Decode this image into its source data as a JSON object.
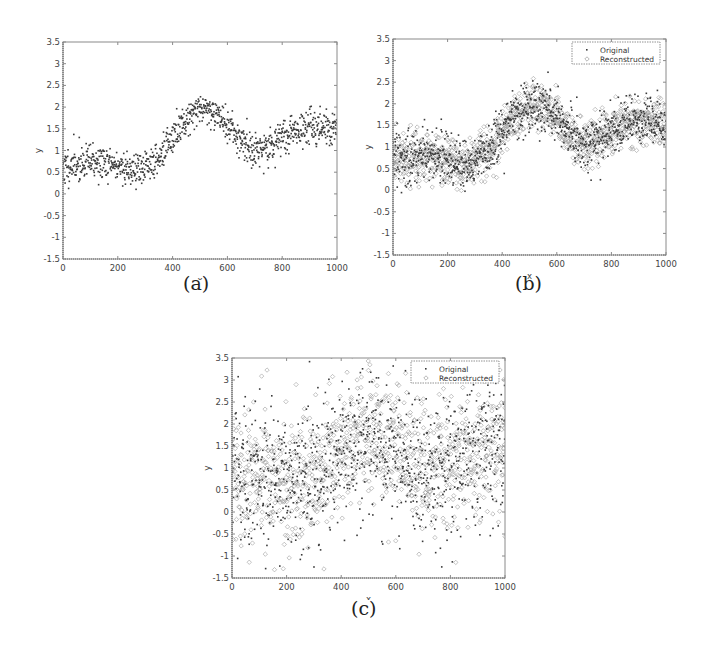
{
  "figure": {
    "captions": [
      "(a)",
      "(b)",
      "(c)"
    ]
  },
  "chart_data": [
    {
      "id": "a",
      "type": "scatter",
      "caption": "(a)",
      "title": "",
      "xlabel": "x",
      "ylabel": "y",
      "xlim": [
        0,
        1000
      ],
      "ylim": [
        -1.5,
        3.5
      ],
      "xticks": [
        0,
        200,
        400,
        600,
        800,
        1000
      ],
      "yticks": [
        -1.5,
        -1,
        -0.5,
        0,
        0.5,
        1,
        1.5,
        2,
        2.5,
        3,
        3.5
      ],
      "grid": false,
      "legend": null,
      "series": [
        {
          "name": "Original",
          "marker": "dot",
          "n_points": 1000,
          "trend_x": [
            0,
            100,
            200,
            250,
            300,
            350,
            400,
            450,
            500,
            550,
            600,
            650,
            700,
            750,
            800,
            850,
            900,
            950,
            1000
          ],
          "trend_y": [
            0.6,
            0.75,
            0.65,
            0.55,
            0.6,
            0.85,
            1.25,
            1.75,
            2.0,
            1.9,
            1.6,
            1.2,
            1.0,
            1.05,
            1.3,
            1.45,
            1.55,
            1.55,
            1.5
          ],
          "noise_sd": 0.2
        }
      ]
    },
    {
      "id": "b",
      "type": "scatter",
      "caption": "(b)",
      "title": "",
      "xlabel": "x",
      "ylabel": "y",
      "xlim": [
        0,
        1000
      ],
      "ylim": [
        -1.5,
        3.5
      ],
      "xticks": [
        0,
        200,
        400,
        600,
        800,
        1000
      ],
      "yticks": [
        -1.5,
        -1,
        -0.5,
        0,
        0.5,
        1,
        1.5,
        2,
        2.5,
        3,
        3.5
      ],
      "grid": false,
      "legend": {
        "position": "upper right",
        "entries": [
          "Original",
          "Reconstructed"
        ]
      },
      "series": [
        {
          "name": "Original",
          "marker": "dot",
          "n_points": 1000,
          "trend_x": [
            0,
            100,
            200,
            250,
            300,
            350,
            400,
            450,
            500,
            550,
            600,
            650,
            700,
            750,
            800,
            850,
            900,
            950,
            1000
          ],
          "trend_y": [
            0.7,
            0.8,
            0.7,
            0.6,
            0.65,
            0.9,
            1.3,
            1.8,
            2.0,
            1.95,
            1.7,
            1.25,
            1.05,
            1.15,
            1.4,
            1.55,
            1.6,
            1.6,
            1.55
          ],
          "noise_sd": 0.3
        },
        {
          "name": "Reconstructed",
          "marker": "diamond",
          "n_points": 1000,
          "trend_x": [
            0,
            100,
            200,
            250,
            300,
            350,
            400,
            450,
            500,
            550,
            600,
            650,
            700,
            750,
            800,
            850,
            900,
            950,
            1000
          ],
          "trend_y": [
            0.7,
            0.8,
            0.7,
            0.6,
            0.65,
            0.9,
            1.3,
            1.8,
            2.0,
            1.95,
            1.7,
            1.25,
            1.05,
            1.15,
            1.4,
            1.55,
            1.6,
            1.6,
            1.55
          ],
          "noise_sd": 0.28
        }
      ]
    },
    {
      "id": "c",
      "type": "scatter",
      "caption": "(c)",
      "title": "",
      "xlabel": "x",
      "ylabel": "y",
      "xlim": [
        0,
        1000
      ],
      "ylim": [
        -1.5,
        3.5
      ],
      "xticks": [
        0,
        200,
        400,
        600,
        800,
        1000
      ],
      "yticks": [
        -1.5,
        -1,
        -0.5,
        0,
        0.5,
        1,
        1.5,
        2,
        2.5,
        3,
        3.5
      ],
      "grid": false,
      "legend": {
        "position": "upper right",
        "entries": [
          "Original",
          "Reconstructed"
        ]
      },
      "series": [
        {
          "name": "Original",
          "marker": "dot",
          "n_points": 1000,
          "trend_x": [
            0,
            100,
            200,
            300,
            400,
            500,
            600,
            700,
            800,
            900,
            1000
          ],
          "trend_y": [
            0.9,
            0.85,
            0.7,
            0.75,
            1.4,
            1.8,
            1.5,
            0.9,
            1.2,
            1.4,
            1.6
          ],
          "noise_sd": 0.75
        },
        {
          "name": "Reconstructed",
          "marker": "diamond",
          "n_points": 1000,
          "trend_x": [
            0,
            100,
            200,
            300,
            400,
            500,
            600,
            700,
            800,
            900,
            1000
          ],
          "trend_y": [
            0.9,
            0.85,
            0.7,
            0.75,
            1.4,
            1.8,
            1.5,
            0.9,
            1.2,
            1.4,
            1.6
          ],
          "noise_sd": 0.65
        }
      ]
    }
  ],
  "colors": {
    "axis": "#8a8a8a",
    "tick_label": "#444444",
    "original_marker": "#3a3a3a",
    "reconstructed_marker": "#9a9a9a"
  }
}
